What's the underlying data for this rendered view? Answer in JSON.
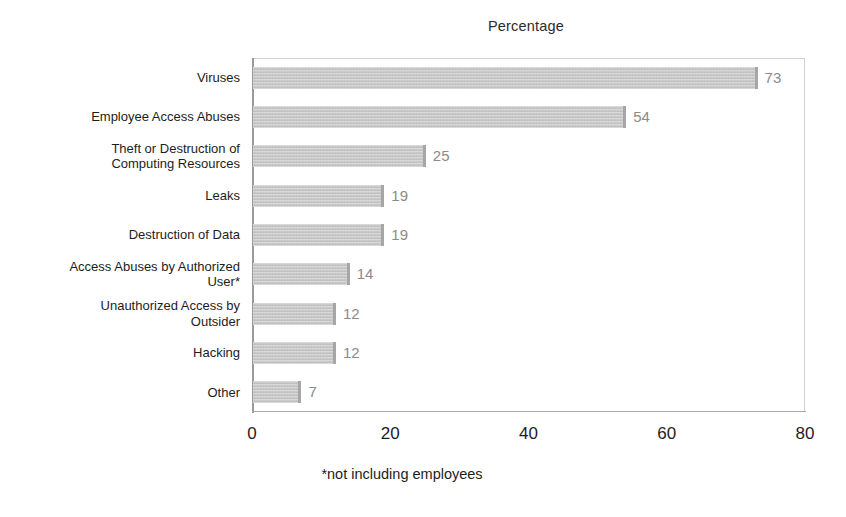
{
  "chart_data": {
    "type": "bar",
    "orientation": "horizontal",
    "title": "Percentage",
    "xlabel": "",
    "ylabel": "",
    "xlim": [
      0,
      80
    ],
    "xticks": [
      "0",
      "20",
      "40",
      "60",
      "80"
    ],
    "grid": false,
    "legend": null,
    "footnote": "*not including employees",
    "bar_color": "#c9c9c9",
    "value_label_color": "#8b8b8b",
    "categories": [
      "Viruses",
      "Employee Access Abuses",
      "Theft or Destruction of\nComputing Resources",
      "Leaks",
      "Destruction of Data",
      "Access Abuses by Authorized\nUser*",
      "Unauthorized Access by\nOutsider",
      "Hacking",
      "Other"
    ],
    "values": [
      73,
      54,
      25,
      19,
      19,
      14,
      12,
      12,
      7
    ],
    "value_labels": [
      "73",
      "54",
      "25",
      "19",
      "19",
      "14",
      "12",
      "12",
      "7"
    ]
  }
}
